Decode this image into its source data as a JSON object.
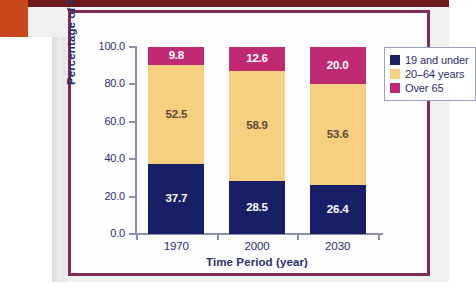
{
  "chart_data": {
    "type": "bar",
    "subtype": "stacked-bar",
    "title": "",
    "xlabel": "Time Period (year)",
    "ylabel": "Percentage of People",
    "categories": [
      "1970",
      "2000",
      "2030"
    ],
    "ylim": [
      0,
      100
    ],
    "yticks": [
      "0.0",
      "20.0",
      "40.0",
      "60.0",
      "80.0",
      "100.0"
    ],
    "ytick_values": [
      0,
      20,
      40,
      60,
      80,
      100
    ],
    "grid": false,
    "legend_position": "right-top",
    "series": [
      {
        "name": "19 and under",
        "color": "#191f66",
        "values": [
          37.7,
          28.5,
          26.4
        ],
        "labels": [
          "37.7",
          "28.5",
          "26.4"
        ]
      },
      {
        "name": "20–64 years",
        "color": "#f7cf80",
        "values": [
          52.5,
          58.9,
          53.6
        ],
        "labels": [
          "52.5",
          "58.9",
          "53.6"
        ]
      },
      {
        "name": "Over 65",
        "color": "#bf2a72",
        "values": [
          9.8,
          12.6,
          20.0
        ],
        "labels": [
          "9.8",
          "12.6",
          "20.0"
        ]
      }
    ]
  },
  "legend": {
    "items": [
      {
        "label": "19 and under",
        "color": "#191f66"
      },
      {
        "label": "20–64 years",
        "color": "#f7cf80"
      },
      {
        "label": "Over 65",
        "color": "#bf2a72"
      }
    ]
  },
  "colors": {
    "page_background": "#f3f1ef",
    "panel_border": "#7d2a5c",
    "top_strip": "#6d1a1c",
    "corner_block": "#c8461a",
    "axis": "#8b8fa8",
    "text": "#2b2f6b"
  }
}
